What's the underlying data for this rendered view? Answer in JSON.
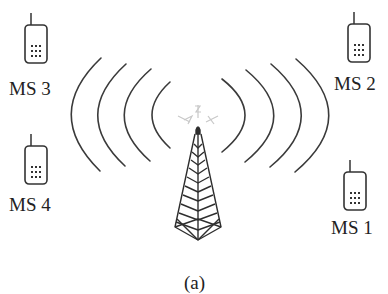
{
  "figure": {
    "caption": "(a)",
    "base_station": {
      "name": "base-station-tower",
      "waves_per_side": 4
    },
    "mobile_stations": [
      {
        "id": "ms1",
        "label": "MS 1"
      },
      {
        "id": "ms2",
        "label": "MS 2"
      },
      {
        "id": "ms3",
        "label": "MS 3"
      },
      {
        "id": "ms4",
        "label": "MS 4"
      }
    ]
  },
  "colors": {
    "stroke": "#333333",
    "faint": "#c8c8c8",
    "background": "#ffffff"
  }
}
